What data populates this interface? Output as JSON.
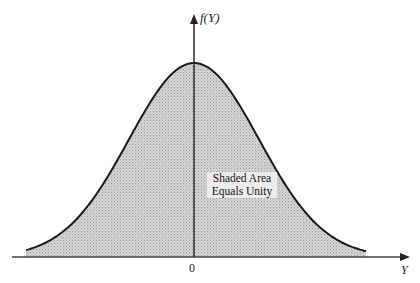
{
  "chart_data": {
    "type": "area",
    "title": "",
    "xlabel": "Y",
    "ylabel": "f(Y)",
    "x_tick_labels": [
      "0"
    ],
    "annotation": "Shaded Area Equals Unity",
    "annotation_lines": [
      "Shaded Area",
      "Equals Unity"
    ],
    "series": [
      {
        "name": "normal density f(Y)",
        "distribution": "normal",
        "mean": 0,
        "shaded": true,
        "x": [
          -2.6,
          -2,
          -1.5,
          -1,
          -0.5,
          0,
          0.5,
          1,
          1.5,
          2,
          2.6
        ],
        "values": [
          0.034,
          0.135,
          0.325,
          0.607,
          0.882,
          1.0,
          0.882,
          0.607,
          0.325,
          0.135,
          0.034
        ]
      }
    ],
    "grid": false,
    "legend": "none",
    "colors": {
      "curve": "#222222",
      "fill": "#c9c9c9",
      "axis": "#333333"
    }
  },
  "labels": {
    "y_axis": "f(Y)",
    "x_axis": "Y",
    "origin": "0",
    "annotation_line1": "Shaded Area",
    "annotation_line2": "Equals Unity"
  }
}
